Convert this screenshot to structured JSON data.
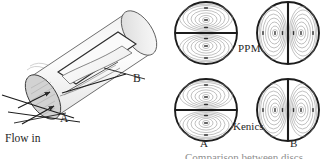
{
  "figure": {
    "background_color": "#ffffff",
    "line_color": "#262626",
    "width": 322,
    "height": 159
  },
  "pipe_diagram": {
    "name": "static-mixer-pipe-cutaway",
    "flow_label": "Flow in",
    "plane_a_label": "A",
    "plane_b_label": "B",
    "description": "Cutaway isometric view of a cylindrical pipe containing a twisted mixing element, with cross-section planes A and B marked"
  },
  "sections": {
    "row_labels": [
      "PPM",
      "Kenics"
    ],
    "column_labels": [
      "A",
      "B"
    ],
    "caption": "Comparison between discs",
    "cells": [
      {
        "row": "PPM",
        "column": "A",
        "divider": "horizontal",
        "vortex_count": 2,
        "vortex_centers": [
          [
            0,
            -0.42
          ],
          [
            0,
            0.42
          ]
        ],
        "note": "two stacked counter-rotating vortices separated by a horizontal blade"
      },
      {
        "row": "PPM",
        "column": "B",
        "divider": "vertical",
        "vortex_count": 2,
        "vortex_centers": [
          [
            -0.42,
            0
          ],
          [
            0.42,
            0
          ]
        ],
        "note": "two side-by-side counter-rotating vortices separated by a vertical blade"
      },
      {
        "row": "Kenics",
        "column": "A",
        "divider": "horizontal",
        "vortex_count": 2,
        "vortex_centers": [
          [
            0,
            -0.4
          ],
          [
            0,
            0.4
          ]
        ],
        "note": "two stacked vortices separated by a horizontal blade"
      },
      {
        "row": "Kenics",
        "column": "B",
        "divider": "vertical",
        "vortex_count": 2,
        "vortex_centers": [
          [
            -0.44,
            0
          ],
          [
            0.44,
            0
          ]
        ],
        "note": "two side-by-side vortices separated by a vertical blade"
      }
    ]
  }
}
